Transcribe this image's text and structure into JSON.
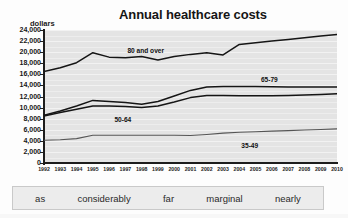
{
  "chart_data": {
    "type": "line",
    "title": "Annual healthcare costs",
    "xlabel": "",
    "ylabel": "dollars",
    "ylim": [
      0,
      24000
    ],
    "ytick_labels": [
      "0",
      "2,000",
      "4,000",
      "6,000",
      "8,000",
      "10,000",
      "12,000",
      "14,000",
      "16,000",
      "18,000",
      "20,000",
      "22,000",
      "24,000"
    ],
    "ytick_values": [
      0,
      2000,
      4000,
      6000,
      8000,
      10000,
      12000,
      14000,
      16000,
      18000,
      20000,
      22000,
      24000
    ],
    "grid": true,
    "grid_style": "horizontal-bands",
    "legend_position": "inline-labels",
    "x": [
      1992,
      1993,
      1994,
      1995,
      1996,
      1997,
      1998,
      1999,
      2000,
      2001,
      2002,
      2003,
      2004,
      2005,
      2006,
      2007,
      2008,
      2009,
      2010
    ],
    "xtick_labels": [
      "1992",
      "1993",
      "1994",
      "1995",
      "1996",
      "1997",
      "1998",
      "1999",
      "2000",
      "2001",
      "2002",
      "2003",
      "2004",
      "2005",
      "2006",
      "2007",
      "2008",
      "2009",
      "2010"
    ],
    "series": [
      {
        "name": "80 and over",
        "values": [
          16500,
          17200,
          18100,
          19900,
          19100,
          19000,
          19200,
          18600,
          19200,
          19600,
          19900,
          19500,
          21400,
          21700,
          22000,
          22300,
          22600,
          22900,
          23200
        ]
      },
      {
        "name": "65-79",
        "values": [
          8600,
          9400,
          10300,
          11300,
          11100,
          10900,
          10600,
          11100,
          12100,
          13100,
          13700,
          13800,
          13800,
          13800,
          13750,
          13720,
          13700,
          13700,
          13700
        ]
      },
      {
        "name": "50-64",
        "values": [
          8500,
          9100,
          9700,
          10300,
          10300,
          10200,
          10000,
          10300,
          11000,
          11800,
          12200,
          12200,
          12150,
          12150,
          12150,
          12200,
          12250,
          12350,
          12500
        ]
      },
      {
        "name": "35-49",
        "values": [
          4100,
          4200,
          4400,
          5000,
          5000,
          5000,
          5000,
          5000,
          5000,
          4950,
          5150,
          5400,
          5550,
          5650,
          5750,
          5850,
          5950,
          6050,
          6150
        ]
      }
    ],
    "series_label_text": [
      "80 and over",
      "65-79",
      "50-64",
      "35-49"
    ]
  },
  "word_bank": {
    "words": [
      "as",
      "considerably",
      "far",
      "marginal",
      "nearly"
    ]
  }
}
